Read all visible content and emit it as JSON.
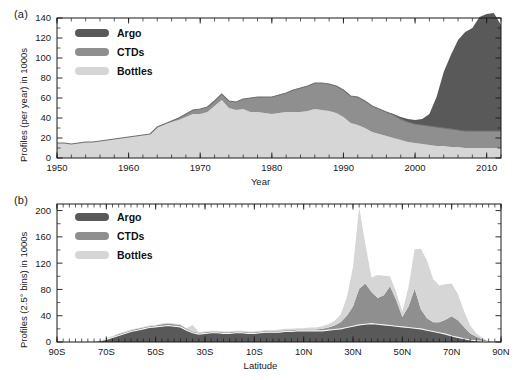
{
  "figure": {
    "panel_a_label": "(a)",
    "panel_b_label": "(b)"
  },
  "colors": {
    "argo": "#595959",
    "ctds": "#8f8f8f",
    "bottles": "#d6d6d6",
    "axis": "#1a1a1a",
    "curve": "#6e6e6e"
  },
  "legend": {
    "items": [
      {
        "label": "Argo",
        "color": "#595959"
      },
      {
        "label": "CTDs",
        "color": "#8f8f8f"
      },
      {
        "label": "Bottles",
        "color": "#d6d6d6"
      }
    ]
  },
  "chart_data": [
    {
      "type": "area",
      "id": "panel-a",
      "title": "",
      "panel": "(a)",
      "stacked": true,
      "xlabel": "Year",
      "ylabel": "Profiles (per year) in 1000s",
      "xlim": [
        1950,
        2012
      ],
      "ylim": [
        0,
        140
      ],
      "yticks": [
        0,
        20,
        40,
        60,
        80,
        100,
        120,
        140
      ],
      "xticks": [
        1950,
        1960,
        1970,
        1980,
        1990,
        2000,
        2010
      ],
      "xtick_labels": [
        "1950",
        "1960",
        "1970",
        "1980",
        "1990",
        "2000",
        "2010"
      ],
      "ytick_labels": [
        "0",
        "20",
        "40",
        "60",
        "80",
        "100",
        "120",
        "140"
      ],
      "x_minor_step": 2,
      "grid": false,
      "legend_position": "top-left",
      "x": [
        1950,
        1951,
        1952,
        1953,
        1954,
        1955,
        1956,
        1957,
        1958,
        1959,
        1960,
        1961,
        1962,
        1963,
        1964,
        1965,
        1966,
        1967,
        1968,
        1969,
        1970,
        1971,
        1972,
        1973,
        1974,
        1975,
        1976,
        1977,
        1978,
        1979,
        1980,
        1981,
        1982,
        1983,
        1984,
        1985,
        1986,
        1987,
        1988,
        1989,
        1990,
        1991,
        1992,
        1993,
        1994,
        1995,
        1996,
        1997,
        1998,
        1999,
        2000,
        2001,
        2002,
        2003,
        2004,
        2005,
        2006,
        2007,
        2008,
        2009,
        2010,
        2011,
        2012
      ],
      "series": [
        {
          "name": "Bottles",
          "color": "#d6d6d6",
          "values": [
            15,
            15,
            14,
            15,
            16,
            16,
            17,
            18,
            19,
            20,
            21,
            22,
            23,
            24,
            31,
            34,
            36,
            38,
            41,
            44,
            44,
            46,
            52,
            58,
            50,
            48,
            49,
            46,
            46,
            45,
            44,
            45,
            46,
            46,
            46,
            47,
            49,
            48,
            47,
            45,
            41,
            35,
            33,
            30,
            26,
            24,
            22,
            20,
            18,
            16,
            15,
            14,
            13,
            12,
            12,
            11,
            11,
            10,
            10,
            10,
            10,
            10,
            10
          ]
        },
        {
          "name": "CTDs",
          "color": "#8f8f8f",
          "values": [
            0,
            0,
            0,
            0,
            0,
            0,
            0,
            0,
            0,
            0,
            0,
            0,
            0,
            0,
            0,
            0,
            1,
            2,
            3,
            4,
            5,
            5,
            5,
            6,
            7,
            8,
            10,
            14,
            15,
            16,
            17,
            18,
            19,
            22,
            24,
            25,
            26,
            27,
            27,
            27,
            27,
            27,
            28,
            27,
            26,
            25,
            24,
            23,
            21,
            20,
            19,
            19,
            19,
            19,
            18,
            18,
            17,
            17,
            17,
            17,
            17,
            17,
            17
          ]
        },
        {
          "name": "Argo",
          "color": "#595959",
          "values": [
            0,
            0,
            0,
            0,
            0,
            0,
            0,
            0,
            0,
            0,
            0,
            0,
            0,
            0,
            0,
            0,
            0,
            0,
            0,
            0,
            0,
            0,
            0,
            0,
            0,
            0,
            0,
            0,
            0,
            0,
            0,
            0,
            0,
            0,
            0,
            0,
            0,
            0,
            0,
            0,
            0,
            0,
            0,
            0,
            0,
            0,
            0,
            1,
            2,
            3,
            4,
            6,
            12,
            30,
            56,
            74,
            90,
            99,
            103,
            114,
            117,
            118,
            106
          ]
        }
      ],
      "overlay_curve": {
        "name": "CTDs cumulative line",
        "description": "dark gray line tracing top of the CTDs+Argo lower stack",
        "color": "#6e6e6e"
      }
    },
    {
      "type": "area",
      "id": "panel-b",
      "title": "",
      "panel": "(b)",
      "stacked": true,
      "xlabel": "Latitude",
      "ylabel": "Profiles (2.5° bins) in 1000s",
      "xlim": [
        -90,
        90
      ],
      "ylim": [
        0,
        210
      ],
      "yticks": [
        0,
        40,
        80,
        120,
        160,
        200
      ],
      "ytick_labels": [
        "0",
        "40",
        "80",
        "120",
        "160",
        "200"
      ],
      "xticks": [
        -90,
        -70,
        -50,
        -30,
        -10,
        10,
        30,
        50,
        70,
        90
      ],
      "xtick_labels": [
        "90S",
        "70S",
        "50S",
        "30S",
        "10S",
        "10N",
        "30N",
        "50N",
        "70N",
        "90N"
      ],
      "x_minor_step": 2.5,
      "grid": false,
      "legend_position": "top-left",
      "x": [
        -90,
        -87.5,
        -85,
        -82.5,
        -80,
        -77.5,
        -75,
        -72.5,
        -70,
        -67.5,
        -65,
        -62.5,
        -60,
        -57.5,
        -55,
        -52.5,
        -50,
        -47.5,
        -45,
        -42.5,
        -40,
        -37.5,
        -35,
        -32.5,
        -30,
        -27.5,
        -25,
        -22.5,
        -20,
        -17.5,
        -15,
        -12.5,
        -10,
        -7.5,
        -5,
        -2.5,
        0,
        2.5,
        5,
        7.5,
        10,
        12.5,
        15,
        17.5,
        20,
        22.5,
        25,
        27.5,
        30,
        32.5,
        35,
        37.5,
        40,
        42.5,
        45,
        47.5,
        50,
        52.5,
        55,
        57.5,
        60,
        62.5,
        65,
        67.5,
        70,
        72.5,
        75,
        77.5,
        80,
        82.5,
        85,
        87.5,
        90
      ],
      "series": [
        {
          "name": "Argo",
          "color": "#595959",
          "values": [
            0,
            0,
            0,
            0,
            0,
            0,
            1,
            2,
            4,
            7,
            10,
            13,
            16,
            18,
            20,
            22,
            23,
            24,
            25,
            24,
            23,
            18,
            14,
            12,
            13,
            14,
            14,
            13,
            13,
            14,
            14,
            13,
            13,
            14,
            15,
            15,
            15,
            16,
            16,
            17,
            17,
            17,
            17,
            17,
            18,
            19,
            20,
            22,
            24,
            26,
            27,
            28,
            27,
            26,
            25,
            24,
            23,
            22,
            21,
            20,
            18,
            16,
            14,
            12,
            9,
            7,
            5,
            3,
            2,
            1,
            0,
            0,
            0
          ]
        },
        {
          "name": "CTDs",
          "color": "#8f8f8f",
          "values": [
            0,
            0,
            0,
            0,
            0,
            0,
            0,
            0,
            1,
            1,
            2,
            2,
            2,
            2,
            2,
            2,
            2,
            3,
            3,
            3,
            3,
            2,
            2,
            2,
            2,
            2,
            2,
            2,
            2,
            2,
            2,
            2,
            2,
            2,
            2,
            2,
            2,
            2,
            2,
            2,
            2,
            2,
            2,
            3,
            4,
            6,
            10,
            18,
            30,
            55,
            62,
            48,
            40,
            45,
            60,
            40,
            15,
            32,
            60,
            30,
            18,
            14,
            16,
            22,
            30,
            26,
            18,
            10,
            6,
            3,
            1,
            0,
            0
          ]
        },
        {
          "name": "Bottles",
          "color": "#d6d6d6",
          "values": [
            0,
            0,
            0,
            0,
            0,
            0,
            0,
            0,
            1,
            1,
            1,
            1,
            1,
            1,
            1,
            1,
            1,
            1,
            1,
            1,
            1,
            1,
            10,
            1,
            1,
            1,
            1,
            1,
            1,
            1,
            1,
            1,
            1,
            1,
            1,
            1,
            2,
            2,
            2,
            2,
            2,
            3,
            3,
            4,
            5,
            7,
            12,
            28,
            60,
            124,
            60,
            22,
            35,
            30,
            15,
            12,
            8,
            30,
            60,
            92,
            88,
            66,
            56,
            54,
            50,
            40,
            24,
            12,
            5,
            2,
            0,
            0,
            0
          ]
        }
      ],
      "overlay_curve": {
        "name": "Argo boundary line",
        "description": "light outline tracing top of Argo layer in southern/tropical region",
        "color": "#f2f2f2"
      }
    }
  ]
}
